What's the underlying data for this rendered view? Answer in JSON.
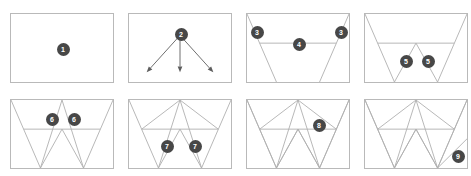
{
  "figure": {
    "kind": "paper-folding-instruction-grid",
    "columns": 4,
    "rows": 2,
    "panel_width": 104,
    "panel_height": 70,
    "badge_color": "#474747",
    "badge_text_color": "#ffffff",
    "fold_line_color": "#b0b0b0",
    "panel_border_color": "#b9b9b9",
    "arrow_color": "#5d5d5d",
    "background_color": "#ffffff"
  },
  "panels": [
    {
      "index": 1,
      "name": "step-1-blank-sheet",
      "description": "Blank rectangular sheet",
      "x": 10,
      "y": 13,
      "folds": [],
      "arrows": [],
      "badges": [
        {
          "label": "1",
          "x": 52,
          "y": 35
        }
      ]
    },
    {
      "index": 2,
      "name": "step-2-fold-direction-arrows",
      "description": "Three arrows radiating downward from a single point",
      "x": 128,
      "y": 13,
      "folds": [],
      "arrows": [
        {
          "x1": 52,
          "y1": 22,
          "x2": 18,
          "y2": 60
        },
        {
          "x1": 52,
          "y1": 22,
          "x2": 52,
          "y2": 60
        },
        {
          "x1": 52,
          "y1": 22,
          "x2": 86,
          "y2": 60
        }
      ],
      "badges": [
        {
          "label": "2",
          "x": 52,
          "y": 20
        }
      ]
    },
    {
      "index": 3,
      "name": "step-3-corner-diagonals",
      "description": "Diagonals from both top corners plus a horizontal crease",
      "x": 246,
      "y": 13,
      "folds": [
        {
          "points": "0,0 30,70"
        },
        {
          "points": "104,0 74,70"
        },
        {
          "points": "13,30 91,30"
        }
      ],
      "arrows": [],
      "badges": [
        {
          "label": "3",
          "x": 10,
          "y": 18
        },
        {
          "label": "3",
          "x": 94,
          "y": 18
        },
        {
          "label": "4",
          "x": 52,
          "y": 30
        }
      ]
    },
    {
      "index": 4,
      "name": "step-4-center-peak",
      "description": "Trapezoid with a central upward peak added",
      "x": 364,
      "y": 13,
      "folds": [
        {
          "points": "0,0 30,70"
        },
        {
          "points": "104,0 74,70"
        },
        {
          "points": "13,30 91,30"
        },
        {
          "points": "30,70 52,30 74,70"
        }
      ],
      "arrows": [],
      "badges": [
        {
          "label": "5",
          "x": 41,
          "y": 47
        },
        {
          "label": "5",
          "x": 63,
          "y": 47
        }
      ]
    },
    {
      "index": 5,
      "name": "step-5-upper-apex",
      "description": "Apex folded up to the top edge forming a W outline",
      "x": 10,
      "y": 99,
      "folds": [
        {
          "points": "0,0 30,70"
        },
        {
          "points": "104,0 74,70"
        },
        {
          "points": "13,30 91,30"
        },
        {
          "points": "30,70 52,30 74,70"
        },
        {
          "points": "30,70 52,0 74,70"
        }
      ],
      "arrows": [],
      "badges": [
        {
          "label": "6",
          "x": 41,
          "y": 19
        },
        {
          "label": "6",
          "x": 63,
          "y": 19
        }
      ]
    },
    {
      "index": 6,
      "name": "step-6-side-creases",
      "description": "Side creases extended to the bottom edge",
      "x": 128,
      "y": 99,
      "folds": [
        {
          "points": "0,0 30,70"
        },
        {
          "points": "104,0 74,70"
        },
        {
          "points": "13,30 91,30"
        },
        {
          "points": "30,70 52,30 74,70"
        },
        {
          "points": "30,70 52,0 74,70"
        },
        {
          "points": "13,30 52,0 91,30"
        }
      ],
      "arrows": [],
      "badges": [
        {
          "label": "7",
          "x": 38,
          "y": 46
        },
        {
          "label": "7",
          "x": 66,
          "y": 46
        }
      ]
    },
    {
      "index": 7,
      "name": "step-7-full-zigzag",
      "description": "Complete zigzag crease pattern",
      "x": 246,
      "y": 99,
      "folds": [
        {
          "points": "0,0 30,70"
        },
        {
          "points": "104,0 74,70"
        },
        {
          "points": "13,30 91,30"
        },
        {
          "points": "30,70 52,30 74,70"
        },
        {
          "points": "30,70 52,0 74,70"
        },
        {
          "points": "13,30 52,0 91,30"
        },
        {
          "points": "0,0 30,70 52,30 74,70 104,0"
        }
      ],
      "arrows": [],
      "badges": [
        {
          "label": "8",
          "x": 72,
          "y": 25
        }
      ]
    },
    {
      "index": 8,
      "name": "step-8-finished-pattern",
      "description": "Finished crease pattern with outer edge fold",
      "x": 364,
      "y": 99,
      "folds": [
        {
          "points": "0,0 30,70"
        },
        {
          "points": "104,0 74,70"
        },
        {
          "points": "13,30 91,30"
        },
        {
          "points": "30,70 52,30 74,70"
        },
        {
          "points": "30,70 52,0 74,70"
        },
        {
          "points": "13,30 52,0 91,30"
        },
        {
          "points": "0,0 30,70 52,30 74,70 104,0"
        },
        {
          "points": "74,70 104,40"
        }
      ],
      "arrows": [],
      "badges": [
        {
          "label": "9",
          "x": 93,
          "y": 56
        }
      ]
    }
  ]
}
